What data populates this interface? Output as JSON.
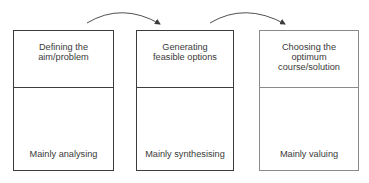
{
  "diagram": {
    "type": "process-flow",
    "stages": [
      {
        "title": "Defining the\naim/problem",
        "mode": "Mainly analysing"
      },
      {
        "title": "Generating\nfeasible options",
        "mode": "Mainly synthesising"
      },
      {
        "title": "Choosing the\noptimum\ncourse/solution",
        "mode": "Mainly valuing"
      }
    ],
    "connectors": [
      {
        "from": 0,
        "to": 1,
        "icon": "curved-arrow-icon"
      },
      {
        "from": 1,
        "to": 2,
        "icon": "curved-arrow-icon"
      }
    ],
    "colors": {
      "line": "#3c3c3c",
      "line_light": "#8a8a8a",
      "text": "#3a3a3a"
    }
  }
}
